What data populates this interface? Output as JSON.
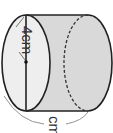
{
  "diagram": {
    "type": "cylinder",
    "orientation": "horizontal",
    "radius_label": "4cm",
    "circumference_label": "cm",
    "colors": {
      "stroke": "#222222",
      "side_fill": "#d9d9d9",
      "face_fill": "#eeeeee",
      "brace": "#888888"
    }
  }
}
